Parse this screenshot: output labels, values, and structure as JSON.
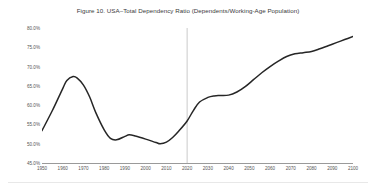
{
  "figure": {
    "title": "Figure 10. USA–Total Dependency Ratio (Dependents/Working-Age Population)",
    "line_color": "#262626",
    "reference_line_color": "#bdbdbd",
    "axis_color": "#9a9a9a",
    "tick_label_color": "#555555",
    "background": "#ffffff"
  },
  "chart_data": {
    "type": "line",
    "title": "Figure 10. USA–Total Dependency Ratio (Dependents/Working-Age Population)",
    "xlabel": "",
    "ylabel": "",
    "xlim": [
      1950,
      2100
    ],
    "ylim": [
      45.0,
      80.0
    ],
    "grid": false,
    "legend": false,
    "y_tick_labels": [
      "80.0%",
      "75.0%",
      "70.0%",
      "65.0%",
      "60.0%",
      "55.0%",
      "50.0%",
      "45.0%"
    ],
    "y_ticks": [
      80.0,
      75.0,
      70.0,
      65.0,
      60.0,
      55.0,
      50.0,
      45.0
    ],
    "x_tick_labels": [
      "1950",
      "1960",
      "1970",
      "1980",
      "1990",
      "2000",
      "2010",
      "2020",
      "2030",
      "2040",
      "2050",
      "2060",
      "2070",
      "2080",
      "2090",
      "2100"
    ],
    "x_ticks": [
      1950,
      1960,
      1970,
      1980,
      1990,
      2000,
      2010,
      2020,
      2030,
      2040,
      2050,
      2060,
      2070,
      2080,
      2090,
      2100
    ],
    "annotations": [
      {
        "type": "vertical-line",
        "x": 2020,
        "label": "projection-start"
      }
    ],
    "series": [
      {
        "name": "USA Total Dependency Ratio",
        "x": [
          1950,
          1955,
          1960,
          1962,
          1965,
          1967,
          1970,
          1973,
          1976,
          1980,
          1983,
          1986,
          1990,
          1992,
          1995,
          2000,
          2005,
          2007,
          2010,
          2013,
          2016,
          2020,
          2023,
          2026,
          2030,
          2033,
          2036,
          2040,
          2044,
          2048,
          2052,
          2056,
          2060,
          2064,
          2068,
          2072,
          2076,
          2080,
          2084,
          2088,
          2092,
          2096,
          2100
        ],
        "y": [
          53.4,
          58.6,
          64.3,
          66.4,
          67.4,
          67.0,
          65.2,
          62.1,
          58.0,
          53.6,
          51.4,
          51.0,
          51.9,
          52.3,
          52.0,
          51.2,
          50.3,
          50.0,
          50.4,
          51.6,
          53.3,
          55.9,
          58.6,
          60.8,
          62.0,
          62.4,
          62.5,
          62.6,
          63.4,
          64.8,
          66.6,
          68.4,
          70.0,
          71.4,
          72.6,
          73.3,
          73.6,
          73.9,
          74.6,
          75.4,
          76.2,
          77.0,
          77.8
        ]
      }
    ]
  }
}
